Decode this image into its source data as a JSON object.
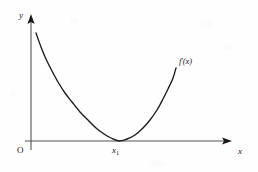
{
  "figure": {
    "background_color": "#fefefe",
    "ink_color": "#1a1a1a",
    "axis_color": "#555555",
    "labels": {
      "y_axis": "y",
      "x_axis": "x",
      "origin": "O",
      "critical_point": "x",
      "critical_point_subscript": "1",
      "curve_function": "f",
      "curve_prime": "'",
      "curve_argument": "(x)"
    }
  },
  "chart_data": {
    "type": "line",
    "title": "",
    "xlabel": "x",
    "ylabel": "y",
    "grid": false,
    "legend": null,
    "axis_arrows": {
      "x": true,
      "y": true
    },
    "annotations": [
      {
        "text": "f'(x)",
        "x": 176,
        "y": 68,
        "placement": "above-right-of-curve-end",
        "note": "curve label at upper right terminus"
      },
      {
        "text": "x1",
        "x": 119,
        "y": 141,
        "placement": "below-axis",
        "note": "tangency point where curve touches x-axis"
      },
      {
        "text": "O",
        "x": 31,
        "y": 141,
        "placement": "below-left-of-origin",
        "note": "origin marker"
      }
    ],
    "series": [
      {
        "name": "f'(x)",
        "description": "Upward-opening parabola-like curve, tangent to the x-axis at x1, decreasing steeply on the left and rising to the right",
        "points_px": [
          [
            36,
            33
          ],
          [
            41,
            47
          ],
          [
            46,
            59
          ],
          [
            52,
            71
          ],
          [
            58,
            82
          ],
          [
            65,
            93
          ],
          [
            72,
            102
          ],
          [
            80,
            112
          ],
          [
            88,
            120
          ],
          [
            96,
            128
          ],
          [
            104,
            134
          ],
          [
            111,
            138
          ],
          [
            119,
            141
          ],
          [
            127,
            139
          ],
          [
            135,
            135
          ],
          [
            143,
            128
          ],
          [
            150,
            120
          ],
          [
            157,
            110
          ],
          [
            163,
            99
          ],
          [
            168,
            89
          ],
          [
            173,
            78
          ],
          [
            176,
            68
          ]
        ],
        "vertex_px": [
          119,
          141
        ],
        "start_px": [
          36,
          33
        ],
        "end_px": [
          176,
          68
        ]
      }
    ],
    "axes_px": {
      "x_axis_y": 141,
      "x_axis_from": 25,
      "x_axis_to": 232,
      "y_axis_x": 31,
      "y_axis_from": 150,
      "y_axis_to": 14
    }
  }
}
